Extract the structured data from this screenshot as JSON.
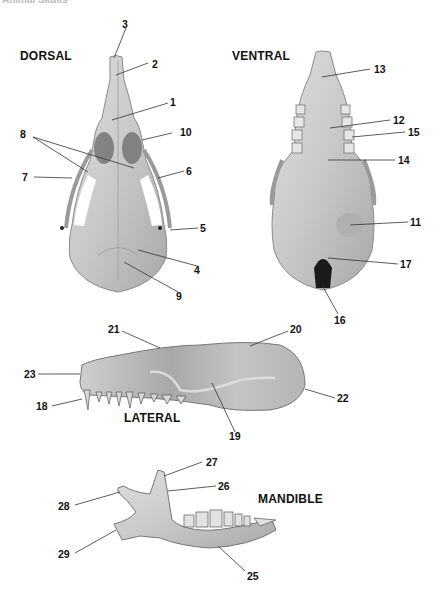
{
  "header": {
    "title": "Animal Skulls"
  },
  "views": {
    "dorsal": "DORSAL",
    "ventral": "VENTRAL",
    "lateral": "LATERAL",
    "mandible": "MANDIBLE"
  },
  "labels": {
    "dorsal": [
      "1",
      "2",
      "3",
      "4",
      "5",
      "6",
      "7",
      "8",
      "9",
      "10"
    ],
    "ventral": [
      "11",
      "12",
      "13",
      "14",
      "15",
      "16",
      "17"
    ],
    "lateral": [
      "18",
      "19",
      "20",
      "21",
      "22",
      "23"
    ],
    "mandible": [
      "25",
      "26",
      "27",
      "28",
      "29"
    ]
  },
  "colors": {
    "bone_light": "#d9d9d9",
    "bone_mid": "#bdbdbd",
    "bone_dark": "#7a7a7a",
    "leader": "#333333"
  }
}
